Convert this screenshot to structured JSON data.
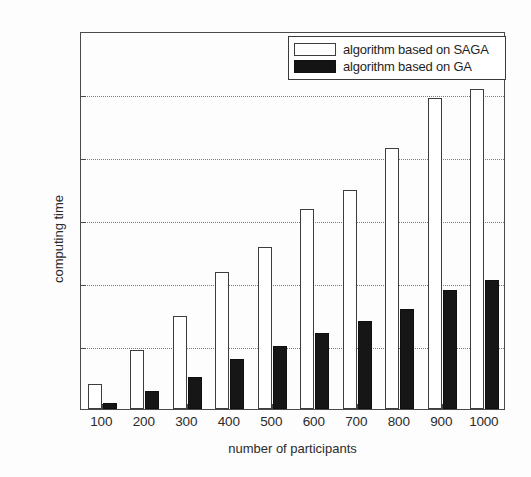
{
  "chart_data": {
    "type": "bar",
    "title": "",
    "xlabel": "number of participants",
    "ylabel": "computing time",
    "categories": [
      "100",
      "200",
      "300",
      "400",
      "500",
      "600",
      "700",
      "800",
      "900",
      "1000"
    ],
    "series": [
      {
        "name": "algorithm based on SAGA",
        "color": "#ffffff",
        "edge_color": "#3d3d3d",
        "values": [
          40,
          94,
          148,
          218,
          257,
          318,
          348,
          414,
          494,
          508
        ]
      },
      {
        "name": "algorithm based on GA",
        "color": "#161616",
        "edge_color": "#101010",
        "values": [
          10,
          29,
          51,
          80,
          100,
          120,
          140,
          159,
          189,
          205
        ]
      }
    ],
    "ylim": [
      0,
      600
    ],
    "yticks": [
      0,
      100,
      200,
      300,
      400,
      500,
      600
    ],
    "ytick_labels": [
      "0",
      "100",
      "200",
      "300",
      "400",
      "500",
      "600"
    ],
    "grid": true,
    "grid_style": "dotted",
    "legend_position": "top-right"
  },
  "legend": {
    "entries": [
      {
        "label": "algorithm based on SAGA",
        "swatch": "hollow-white-square"
      },
      {
        "label": "algorithm based on GA",
        "swatch": "filled-black-square"
      }
    ]
  }
}
